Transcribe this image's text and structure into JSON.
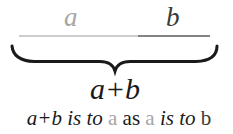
{
  "diagram": {
    "segment_a": {
      "label": "a",
      "color": "#a6a6a6",
      "x1": 19,
      "x2": 138
    },
    "segment_b": {
      "label": "b",
      "color": "#555555",
      "x1": 138,
      "x2": 210
    },
    "line_y": 36,
    "brace": {
      "x1": 12,
      "x2": 217,
      "top_y": 46,
      "bar_y": 62,
      "tip_y": 71,
      "tip_x": 115,
      "color": "#1a1a1a"
    },
    "sum_label": "a+b",
    "caption": {
      "part1": "a+b is to",
      "a1": "a",
      "as": "as",
      "a2": "a",
      "part2": "is to",
      "b": "b"
    },
    "colors": {
      "gray": "#a6a6a6",
      "dark": "#1a1a1a",
      "b_label": "#3a3a3a"
    }
  }
}
